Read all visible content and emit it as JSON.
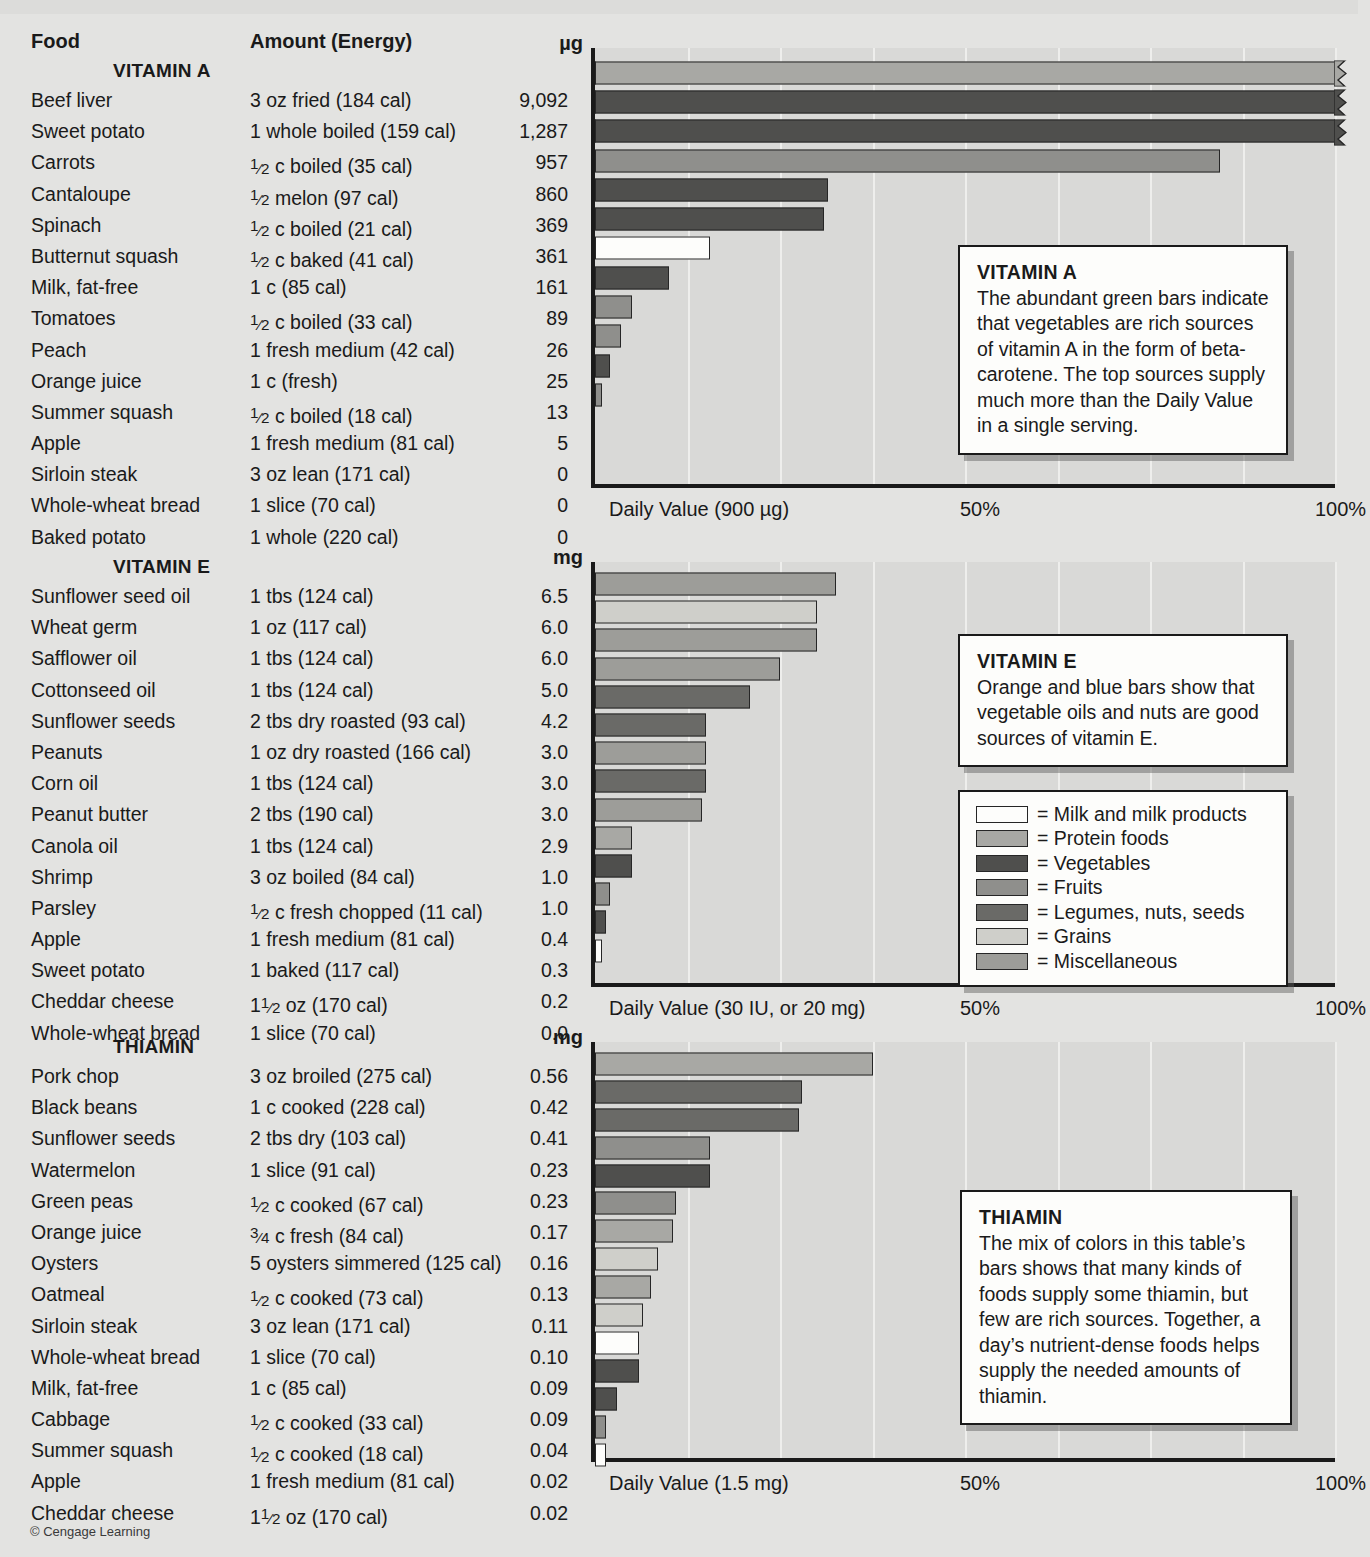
{
  "figure": {
    "copyright": "© Cengage Learning",
    "columns": {
      "food": "Food",
      "amount": "Amount (Energy)"
    }
  },
  "legend": {
    "items": [
      {
        "label": "= Milk and milk products",
        "key": "milk",
        "color": "#fdfdfb"
      },
      {
        "label": "= Protein foods",
        "key": "prot",
        "color": "#a8a8a4"
      },
      {
        "label": "= Vegetables",
        "key": "veg",
        "color": "#4f4f4d"
      },
      {
        "label": "= Fruits",
        "key": "fruit",
        "color": "#8f8f8c"
      },
      {
        "label": "= Legumes, nuts, seeds",
        "key": "leg",
        "color": "#6a6a67"
      },
      {
        "label": "= Grains",
        "key": "grain",
        "color": "#cfcfca"
      },
      {
        "label": "= Miscellaneous",
        "key": "misc",
        "color": "#9d9d99"
      }
    ]
  },
  "chart_data": [
    {
      "type": "bar",
      "title": "VITAMIN A",
      "unit": "µg",
      "xlabel": "Daily Value (900 µg)",
      "ticks": [
        "50%",
        "100%"
      ],
      "xlim": [
        0,
        100
      ],
      "grid": true,
      "orientation": "horizontal",
      "categories": [
        "Beef liver",
        "Sweet potato",
        "Carrots",
        "Cantaloupe",
        "Spinach",
        "Butternut squash",
        "Milk, fat-free",
        "Tomatoes",
        "Peach",
        "Orange juice",
        "Summer squash",
        "Apple",
        "Sirloin steak",
        "Whole-wheat bread",
        "Baked potato"
      ],
      "amounts": [
        "3 oz fried (184 cal)",
        "1 whole boiled (159 cal)",
        "1/2 c boiled (35 cal)",
        "1/2 melon (97 cal)",
        "1/2 c boiled (21 cal)",
        "1/2 c baked (41 cal)",
        "1 c (85 cal)",
        "1/2 c boiled (33 cal)",
        "1 fresh medium (42 cal)",
        "1 c (fresh)",
        "1/2 c boiled (18 cal)",
        "1 fresh medium (81 cal)",
        "3 oz lean (171 cal)",
        "1 slice (70 cal)",
        "1 whole (220 cal)"
      ],
      "values": [
        9092,
        1287,
        957,
        860,
        369,
        361,
        161,
        89,
        26,
        25,
        13,
        5,
        0,
        0,
        0
      ],
      "value_labels": [
        "9,092",
        "1,287",
        "957",
        "860",
        "369",
        "361",
        "161",
        "89",
        "26",
        "25",
        "13",
        "5",
        "0",
        "0",
        "0"
      ],
      "percents": [
        100,
        100,
        100,
        84.5,
        31.5,
        31.0,
        15.5,
        10.0,
        5.0,
        3.5,
        2.0,
        1.0,
        0,
        0,
        0
      ],
      "broken": [
        true,
        true,
        true,
        false,
        false,
        false,
        false,
        false,
        false,
        false,
        false,
        false,
        false,
        false,
        false
      ],
      "groups": [
        "prot",
        "veg",
        "veg",
        "fruit",
        "veg",
        "veg",
        "milk",
        "veg",
        "fruit",
        "fruit",
        "veg",
        "fruit",
        "prot",
        "grain",
        "veg"
      ],
      "callout": {
        "title": "VITAMIN A",
        "body": "The abundant green bars indicate that vegetables are rich sources of vitamin A in the form of beta-carotene. The top sources supply much more than the Daily Value in a single serving."
      }
    },
    {
      "type": "bar",
      "title": "VITAMIN E",
      "unit": "mg",
      "xlabel": "Daily Value (30 IU, or 20 mg)",
      "ticks": [
        "50%",
        "100%"
      ],
      "xlim": [
        0,
        100
      ],
      "grid": true,
      "orientation": "horizontal",
      "categories": [
        "Sunflower seed oil",
        "Wheat germ",
        "Safflower oil",
        "Cottonseed oil",
        "Sunflower seeds",
        "Peanuts",
        "Corn oil",
        "Peanut butter",
        "Canola oil",
        "Shrimp",
        "Parsley",
        "Apple",
        "Sweet potato",
        "Cheddar cheese",
        "Whole-wheat bread"
      ],
      "amounts": [
        "1 tbs (124 cal)",
        "1 oz (117 cal)",
        "1 tbs (124 cal)",
        "1 tbs (124 cal)",
        "2 tbs dry roasted (93 cal)",
        "1 oz dry roasted (166 cal)",
        "1 tbs (124 cal)",
        "2 tbs (190 cal)",
        "1 tbs (124 cal)",
        "3 oz boiled (84 cal)",
        "1/2 c fresh chopped (11 cal)",
        "1 fresh medium (81 cal)",
        "1 baked (117 cal)",
        "1 1/2 oz (170 cal)",
        "1 slice (70 cal)"
      ],
      "values": [
        6.5,
        6.0,
        6.0,
        5.0,
        4.2,
        3.0,
        3.0,
        3.0,
        2.9,
        1.0,
        1.0,
        0.4,
        0.3,
        0.2,
        0.0
      ],
      "value_labels": [
        "6.5",
        "6.0",
        "6.0",
        "5.0",
        "4.2",
        "3.0",
        "3.0",
        "3.0",
        "2.9",
        "1.0",
        "1.0",
        "0.4",
        "0.3",
        "0.2",
        "0.0"
      ],
      "percents": [
        32.5,
        30.0,
        30.0,
        25.0,
        21.0,
        15.0,
        15.0,
        15.0,
        14.5,
        5.0,
        5.0,
        2.0,
        1.5,
        1.0,
        0
      ],
      "broken": [
        false,
        false,
        false,
        false,
        false,
        false,
        false,
        false,
        false,
        false,
        false,
        false,
        false,
        false,
        false
      ],
      "groups": [
        "misc",
        "grain",
        "misc",
        "misc",
        "leg",
        "leg",
        "misc",
        "leg",
        "misc",
        "prot",
        "veg",
        "fruit",
        "veg",
        "milk",
        "grain"
      ],
      "callout": {
        "title": "VITAMIN E",
        "body": "Orange and blue bars show that vegetable oils and nuts are good sources of vitamin E."
      }
    },
    {
      "type": "bar",
      "title": "THIAMIN",
      "unit": "mg",
      "xlabel": "Daily Value (1.5 mg)",
      "ticks": [
        "50%",
        "100%"
      ],
      "xlim": [
        0,
        100
      ],
      "grid": true,
      "orientation": "horizontal",
      "categories": [
        "Pork chop",
        "Black beans",
        "Sunflower seeds",
        "Watermelon",
        "Green peas",
        "Orange juice",
        "Oysters",
        "Oatmeal",
        "Sirloin steak",
        "Whole-wheat bread",
        "Milk, fat-free",
        "Cabbage",
        "Summer squash",
        "Apple",
        "Cheddar cheese"
      ],
      "amounts": [
        "3 oz broiled  (275 cal)",
        "1 c cooked (228 cal)",
        "2 tbs dry (103 cal)",
        "1 slice (91 cal)",
        "1/2 c cooked (67 cal)",
        "3/4 c fresh (84 cal)",
        "5 oysters simmered (125 cal)",
        "1/2 c cooked (73 cal)",
        "3 oz lean (171 cal)",
        "1 slice (70 cal)",
        "1 c (85 cal)",
        "1/2 c cooked (33 cal)",
        "1/2 c cooked (18 cal)",
        "1 fresh medium (81 cal)",
        "1 1/2 oz (170 cal)"
      ],
      "values": [
        0.56,
        0.42,
        0.41,
        0.23,
        0.23,
        0.17,
        0.16,
        0.13,
        0.11,
        0.1,
        0.09,
        0.09,
        0.04,
        0.02,
        0.02
      ],
      "value_labels": [
        "0.56",
        "0.42",
        "0.41",
        "0.23",
        "0.23",
        "0.17",
        "0.16",
        "0.13",
        "0.11",
        "0.10",
        "0.09",
        "0.09",
        "0.04",
        "0.02",
        "0.02"
      ],
      "percents": [
        37.5,
        28.0,
        27.5,
        15.5,
        15.5,
        11.0,
        10.5,
        8.5,
        7.5,
        6.5,
        6.0,
        6.0,
        3.0,
        1.5,
        1.5
      ],
      "broken": [
        false,
        false,
        false,
        false,
        false,
        false,
        false,
        false,
        false,
        false,
        false,
        false,
        false,
        false,
        false
      ],
      "groups": [
        "prot",
        "leg",
        "leg",
        "fruit",
        "veg",
        "fruit",
        "prot",
        "grain",
        "prot",
        "grain",
        "milk",
        "veg",
        "veg",
        "fruit",
        "milk"
      ],
      "callout": {
        "title": "THIAMIN",
        "body": "The mix of colors in this table’s bars shows that many kinds of foods supply some thiamin, but few are rich sources. Together, a day’s nutrient-dense foods helps supply the needed amounts of thiamin."
      }
    }
  ]
}
